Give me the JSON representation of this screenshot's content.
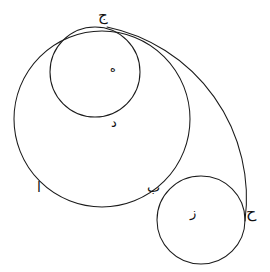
{
  "figure": {
    "background_color": "#ffffff",
    "stroke_color": "#1b1b1b",
    "width": 270,
    "height": 272
  },
  "labels": {
    "alif": "ا",
    "beh": "ب",
    "jeem": "ج",
    "dal": "د",
    "heh": "ه",
    "zay": "ز",
    "hah": "ح"
  },
  "chart_data": {
    "type": "diagram",
    "shapes": [
      {
        "name": "large-circle",
        "kind": "circle",
        "cx": 102,
        "cy": 119,
        "r": 88,
        "label": "ا"
      },
      {
        "name": "upper-small-circle",
        "kind": "circle",
        "cx": 95,
        "cy": 72,
        "r": 45,
        "label": "ه"
      },
      {
        "name": "lower-right-circle",
        "kind": "circle",
        "cx": 201,
        "cy": 220,
        "r": 44,
        "label": "ز"
      },
      {
        "name": "crossing-arc",
        "kind": "arc",
        "from": "ج",
        "through": "د",
        "to": "ح",
        "start": [
          107,
          27
        ],
        "end": [
          245,
          221
        ],
        "radius": 175,
        "sweep": "clockwise"
      }
    ],
    "points": [
      {
        "name": "jeem",
        "label": "ج",
        "x": 107,
        "y": 27,
        "note": "top tangency of large and upper-small circles, start of arc"
      },
      {
        "name": "heh",
        "label": "ه",
        "x": 113,
        "y": 68,
        "note": "interior marker of upper small circle"
      },
      {
        "name": "dal",
        "label": "د",
        "x": 116,
        "y": 121,
        "note": "arc crossing the upper small circle"
      },
      {
        "name": "beh",
        "label": "ب",
        "x": 153,
        "y": 187,
        "note": "arc crossing large circle and lower-right circle"
      },
      {
        "name": "zay",
        "label": "ز",
        "x": 194,
        "y": 212,
        "note": "interior marker of lower-right circle"
      },
      {
        "name": "hah",
        "label": "ح",
        "x": 248,
        "y": 212,
        "note": "right end of arc on lower-right circle"
      },
      {
        "name": "alif",
        "label": "ا",
        "x": 40,
        "y": 186,
        "note": "marker on lower-left of large circle"
      }
    ],
    "axes": "none",
    "grid": false,
    "legend": "none"
  }
}
